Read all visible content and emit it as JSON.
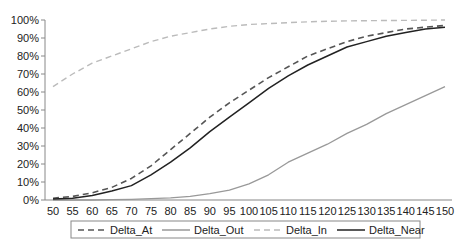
{
  "chart_data": {
    "type": "line",
    "title": "",
    "xlabel": "",
    "ylabel": "",
    "x": [
      50,
      55,
      60,
      65,
      70,
      75,
      80,
      85,
      90,
      95,
      100,
      105,
      110,
      115,
      120,
      125,
      130,
      135,
      140,
      145,
      150
    ],
    "x_tick_labels": [
      "50",
      "55",
      "60",
      "65",
      "70",
      "75",
      "80",
      "85",
      "90",
      "95",
      "100",
      "105",
      "110",
      "115",
      "120",
      "125",
      "130",
      "135",
      "140",
      "145",
      "150"
    ],
    "y_tick_labels": [
      "0%",
      "10%",
      "20%",
      "30%",
      "40%",
      "50%",
      "60%",
      "70%",
      "80%",
      "90%",
      "100%"
    ],
    "ylim": [
      0,
      100
    ],
    "xlim": [
      50,
      150
    ],
    "grid": false,
    "legend_position": "bottom",
    "series": [
      {
        "name": "Delta_At",
        "style": "dashed",
        "color": "#555555",
        "values": [
          1,
          2,
          4,
          7,
          12,
          19,
          28,
          37,
          46,
          54,
          61,
          68,
          74,
          80,
          84,
          88,
          91,
          93,
          95,
          96,
          97
        ]
      },
      {
        "name": "Delta_Out",
        "style": "solid",
        "color": "#999999",
        "values": [
          0,
          0,
          0,
          0.2,
          0.4,
          0.7,
          1.2,
          2,
          3.5,
          5.5,
          9,
          14,
          21,
          26,
          31,
          37,
          42,
          48,
          53,
          58,
          63
        ]
      },
      {
        "name": "Delta_In",
        "style": "dashed",
        "color": "#bbbbbb",
        "values": [
          63,
          70,
          76,
          80,
          84,
          88,
          91,
          93,
          95,
          96.5,
          97.5,
          98,
          98.5,
          99,
          99.3,
          99.5,
          99.6,
          99.7,
          99.8,
          99.9,
          100
        ]
      },
      {
        "name": "Delta_Near",
        "style": "solid",
        "color": "#222222",
        "values": [
          0.5,
          1,
          2.5,
          5,
          8,
          14,
          21,
          29,
          38,
          46,
          54,
          62,
          69,
          75,
          80,
          85,
          88,
          91,
          93,
          95,
          96
        ]
      }
    ]
  }
}
